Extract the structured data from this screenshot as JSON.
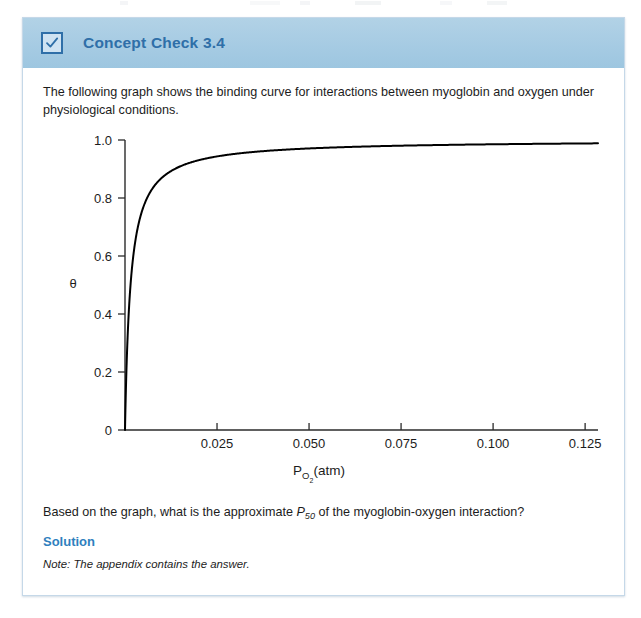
{
  "card": {
    "header": {
      "icon": "checkbox-checked-icon",
      "title": "Concept Check 3.4",
      "background_color": "#a6cbe3",
      "title_color": "#2f6fa8"
    },
    "intro_text": "The following graph shows the binding curve for interactions between myoglobin and oxygen under physiological conditions.",
    "question_prefix": "Based on the graph, what is the approximate ",
    "question_symbol": "P",
    "question_symbol_sub": "50",
    "question_suffix": " of the myoglobin-oxygen interaction?",
    "solution_heading": "Solution",
    "solution_heading_color": "#2f7fbe",
    "note_text": "Note: The appendix contains the answer."
  },
  "chart_data": {
    "type": "line",
    "title": "",
    "xlabel_main": "P",
    "xlabel_sub": "O",
    "xlabel_sub2": "2",
    "xlabel_unit": "(atm)",
    "ylabel": "θ",
    "xlim": [
      0,
      0.1285
    ],
    "ylim": [
      0,
      1.0
    ],
    "xticks": [
      0.025,
      0.05,
      0.075,
      0.1,
      0.125
    ],
    "xtick_labels": [
      "0.025",
      "0.050",
      "0.075",
      "0.100",
      "0.125"
    ],
    "yticks": [
      0,
      0.2,
      0.4,
      0.6,
      0.8,
      1.0
    ],
    "ytick_labels": [
      "0",
      "0.2",
      "0.4",
      "0.6",
      "0.8",
      "1.0"
    ],
    "grid": false,
    "legend": null,
    "curve_model": "hyperbolic binding: theta = P / (P50 + P)",
    "p50": 0.0015,
    "line_color": "#000000",
    "line_width": 2.0,
    "x": [
      0,
      0.0002,
      0.0005,
      0.00075,
      0.001,
      0.0015,
      0.002,
      0.0025,
      0.003,
      0.004,
      0.005,
      0.006,
      0.008,
      0.01,
      0.0125,
      0.015,
      0.02,
      0.025,
      0.03,
      0.04,
      0.05,
      0.06,
      0.07,
      0.08,
      0.09,
      0.1,
      0.11,
      0.12,
      0.1285
    ],
    "y": [
      0,
      0.118,
      0.25,
      0.333,
      0.4,
      0.5,
      0.571,
      0.625,
      0.667,
      0.727,
      0.769,
      0.8,
      0.842,
      0.87,
      0.893,
      0.909,
      0.93,
      0.943,
      0.952,
      0.964,
      0.971,
      0.976,
      0.979,
      0.982,
      0.984,
      0.985,
      0.987,
      0.988,
      0.988
    ]
  }
}
